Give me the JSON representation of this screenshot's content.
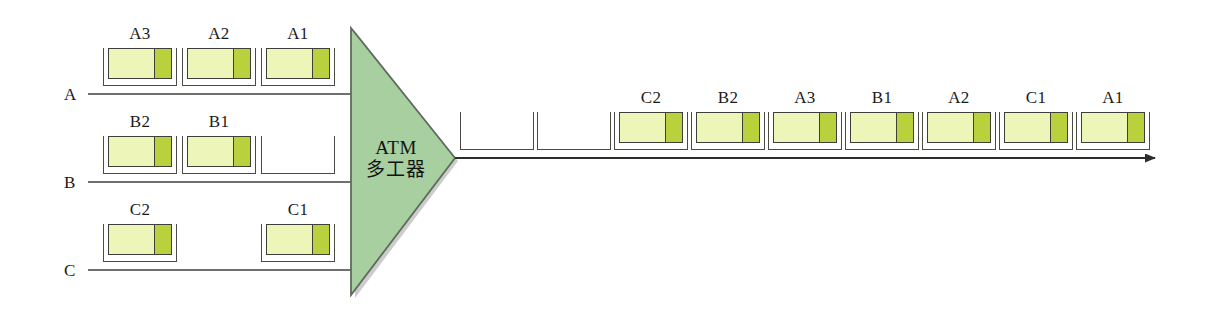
{
  "diagram": {
    "background_color": "#ffffff",
    "line_color": "#3f3f3a",
    "mux": {
      "name": "atm-multiplexer",
      "label_line1": "ATM",
      "label_line2": "多工器",
      "fill_color": "#a8cfa0",
      "stroke_color": "#5f6b5c"
    },
    "cell_style": {
      "payload_color": "#eef5b8",
      "header_color": "#b9d13c",
      "border_color": "#3f3f3a"
    },
    "input_lines": [
      {
        "id": "line-a",
        "label": "A",
        "slots": [
          {
            "label": "A3",
            "filled": true
          },
          {
            "label": "A2",
            "filled": true
          },
          {
            "label": "A1",
            "filled": true
          }
        ]
      },
      {
        "id": "line-b",
        "label": "B",
        "slots": [
          {
            "label": "B2",
            "filled": true
          },
          {
            "label": "B1",
            "filled": true
          },
          {
            "label": "",
            "filled": false
          }
        ]
      },
      {
        "id": "line-c",
        "label": "C",
        "slots": [
          {
            "label": "C2",
            "filled": true
          },
          {
            "label": "",
            "filled": false
          },
          {
            "label": "C1",
            "filled": true
          }
        ]
      }
    ],
    "output_line": {
      "id": "line-output",
      "direction": "right",
      "slots": [
        {
          "label": "",
          "filled": false
        },
        {
          "label": "",
          "filled": false
        },
        {
          "label": "C2",
          "filled": true
        },
        {
          "label": "B2",
          "filled": true
        },
        {
          "label": "A3",
          "filled": true
        },
        {
          "label": "B1",
          "filled": true
        },
        {
          "label": "A2",
          "filled": true
        },
        {
          "label": "C1",
          "filled": true
        },
        {
          "label": "A1",
          "filled": true
        }
      ]
    }
  }
}
